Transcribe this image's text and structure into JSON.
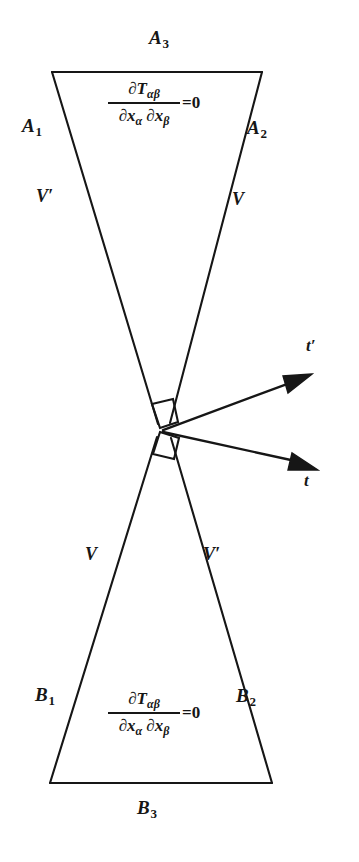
{
  "figure": {
    "type": "physics-light-cone-diagram",
    "background_color": "#ffffff",
    "ink_color": "#161616",
    "width": 359,
    "height": 862
  },
  "upper_cone": {
    "side_left_label": "A",
    "side_left_sub": "1",
    "side_right_label": "A",
    "side_right_sub": "2",
    "top_label": "A",
    "top_sub": "3",
    "velocity_left": "V",
    "velocity_left_prime": "′",
    "velocity_right": "V",
    "equation": {
      "numerator_partial": "∂",
      "numerator_tensor": "T",
      "numerator_indices": "αβ",
      "denominator_partial_1": "∂",
      "denominator_x_1": "x",
      "denominator_index_1": "α",
      "denominator_partial_2": "∂",
      "denominator_x_2": "x",
      "denominator_index_2": "β",
      "rhs": "=0"
    }
  },
  "lower_cone": {
    "side_left_label": "B",
    "side_left_sub": "1",
    "side_right_label": "B",
    "side_right_sub": "2",
    "bottom_label": "B",
    "bottom_sub": "3",
    "velocity_left": "V",
    "velocity_right": "V",
    "velocity_right_prime": "′",
    "equation": {
      "numerator_partial": "∂",
      "numerator_tensor": "T",
      "numerator_indices": "αβ",
      "denominator_partial_1": "∂",
      "denominator_x_1": "x",
      "denominator_index_1": "α",
      "denominator_partial_2": "∂",
      "denominator_x_2": "x",
      "denominator_index_2": "β",
      "rhs": "=0"
    }
  },
  "axes": {
    "upper_arrow_label": "t",
    "upper_arrow_prime": "′",
    "lower_arrow_label": "t"
  },
  "geometry": {
    "apex_x": 163,
    "apex_y": 430,
    "upper_top_left_x": 52,
    "upper_top_left_y": 72,
    "upper_top_right_x": 262,
    "upper_top_right_y": 72,
    "lower_base_left_x": 50,
    "lower_base_left_y": 783,
    "lower_base_right_x": 272,
    "lower_base_right_y": 783,
    "arrow_upper_tip_x": 312,
    "arrow_upper_tip_y": 374,
    "arrow_lower_tip_x": 318,
    "arrow_lower_tip_y": 470
  }
}
